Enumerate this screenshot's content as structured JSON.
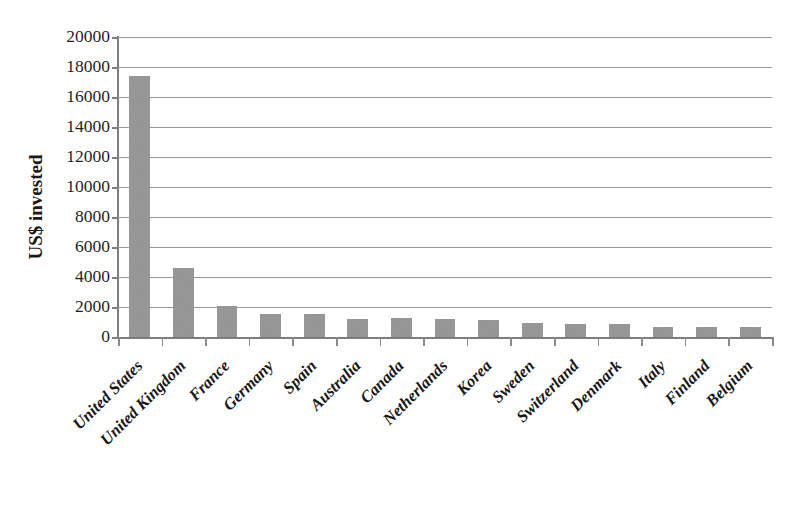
{
  "chart_data": {
    "type": "bar",
    "title": "",
    "subtitle": "",
    "xlabel": "",
    "ylabel": "US$ invested",
    "ylim": [
      0,
      20000
    ],
    "ytick_step": 2000,
    "yticks": [
      20000,
      18000,
      16000,
      14000,
      12000,
      10000,
      8000,
      6000,
      4000,
      2000,
      0
    ],
    "ytick_labels": [
      "20000",
      "18000",
      "16000",
      "14000",
      "12000",
      "10000",
      "8000",
      "6000",
      "4000",
      "2000",
      "0"
    ],
    "grid": true,
    "grid_axis": "y",
    "legend": false,
    "legend_position": "none",
    "bar_color": "#8e8e8e",
    "categories": [
      "United States",
      "United Kingdom",
      "France",
      "Germany",
      "Spain",
      "Australia",
      "Canada",
      "Netherlands",
      "Korea",
      "Sweden",
      "Switzerland",
      "Denmark",
      "Italy",
      "Finland",
      "Belgium"
    ],
    "values": [
      17400,
      4620,
      2050,
      1560,
      1550,
      1210,
      1280,
      1200,
      1160,
      920,
      880,
      870,
      700,
      660,
      640
    ]
  }
}
